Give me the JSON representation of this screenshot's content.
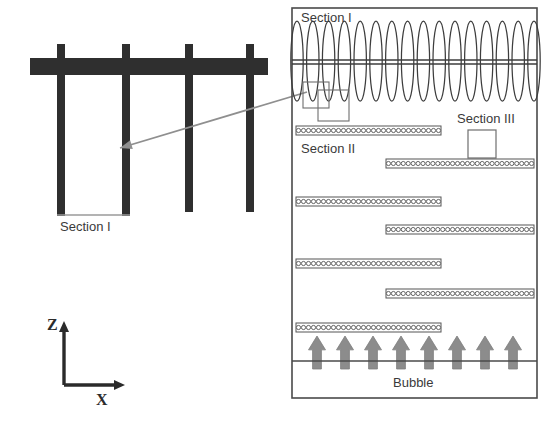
{
  "figure": {
    "background": "#ffffff"
  },
  "labels": {
    "section_one_left": "Section I",
    "section_one_right": "Section I",
    "section_two": "Section II",
    "section_three": "Section III",
    "bubble": "Bubble",
    "axis_z": "Z",
    "axis_x": "X"
  },
  "colors": {
    "ink": "#2b2b2b",
    "text": "#3a3a3a",
    "frame": "#4a4a4a",
    "bar_fill": "#2f2f2f",
    "coil_stroke": "#3d3d3d",
    "bead_stroke": "#555555",
    "bead_fill": "#ffffff",
    "arrow_gray": "#8c8c8c",
    "callout_stroke": "#6e6e6e",
    "pointer_gray": "#8f8f8f"
  },
  "left_panel": {
    "name": "tube-bundle-detail",
    "header_bar": {
      "x": 30,
      "y": 58,
      "width": 238,
      "height": 17
    },
    "posts": [
      {
        "x": 57,
        "top": 44,
        "bottom": 216,
        "width": 8
      },
      {
        "x": 122,
        "top": 44,
        "bottom": 216,
        "width": 8
      },
      {
        "x": 185,
        "top": 44,
        "bottom": 212,
        "width": 8
      },
      {
        "x": 246,
        "top": 44,
        "bottom": 212,
        "width": 8
      }
    ],
    "bottom_connector": {
      "x1": 57,
      "x2": 130,
      "y": 215
    },
    "pointer_arrow": {
      "x1": 307,
      "y1": 92,
      "x2": 120,
      "y2": 148
    }
  },
  "axes": {
    "origin_x": 64,
    "origin_y": 385,
    "z_length": 55,
    "x_length": 52
  },
  "right_panel": {
    "name": "column-schematic",
    "frame": {
      "x": 292,
      "y": 8,
      "width": 245,
      "height": 390
    },
    "coil": {
      "loop_count": 16,
      "x_start": 297,
      "x_end": 534,
      "top": 21,
      "bottom": 101,
      "axis_line_y": 62,
      "loop_rx": 6.2
    },
    "callouts": [
      {
        "x": 303,
        "y": 82,
        "width": 26,
        "height": 26
      },
      {
        "x": 318,
        "y": 90,
        "width": 31,
        "height": 31
      }
    ],
    "section_three_box": {
      "x": 468,
      "y": 130,
      "width": 28,
      "height": 28
    },
    "bead_rows": [
      {
        "align": "left",
        "x": 296,
        "y": 126,
        "width": 145,
        "beads": 29
      },
      {
        "align": "right",
        "x": 386,
        "y": 159,
        "width": 148,
        "beads": 30
      },
      {
        "align": "left",
        "x": 296,
        "y": 197,
        "width": 145,
        "beads": 29
      },
      {
        "align": "right",
        "x": 386,
        "y": 225,
        "width": 148,
        "beads": 30
      },
      {
        "align": "left",
        "x": 296,
        "y": 259,
        "width": 145,
        "beads": 29
      },
      {
        "align": "right",
        "x": 386,
        "y": 289,
        "width": 148,
        "beads": 30
      },
      {
        "align": "left",
        "x": 296,
        "y": 323,
        "width": 145,
        "beads": 29
      }
    ],
    "bubble_zone": {
      "arrow_count": 8,
      "arrow_x_start": 317,
      "arrow_spacing": 28,
      "arrow_top": 336,
      "arrow_height": 33,
      "arrow_width": 17,
      "baseline_y": 361
    }
  }
}
